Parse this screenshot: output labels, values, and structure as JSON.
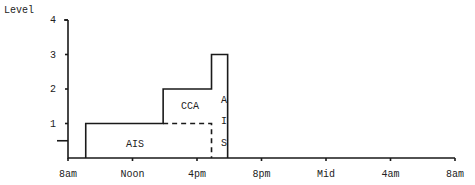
{
  "chart_data": {
    "type": "step-area",
    "title": "",
    "ylabel": "Level",
    "xlabel": "",
    "ylim": [
      0,
      4
    ],
    "y_ticks": [
      "1",
      "2",
      "3",
      "4"
    ],
    "x_ticks": [
      "8am",
      "Noon",
      "4pm",
      "8pm",
      "Mid",
      "4am",
      "8am"
    ],
    "x_range_hours": [
      0,
      24
    ],
    "grid": false,
    "legend": null,
    "outline": [
      {
        "from_hour": 1.1,
        "to_hour": 5.9,
        "level": 1
      },
      {
        "from_hour": 5.9,
        "to_hour": 8.9,
        "level": 2
      },
      {
        "from_hour": 8.9,
        "to_hour": 9.9,
        "level": 3
      }
    ],
    "regions": [
      {
        "label": "AIS",
        "from_hour": 1.1,
        "to_hour": 8.9,
        "level": 1,
        "boundary": "dashed"
      },
      {
        "label": "CCA",
        "from_hour": 5.9,
        "to_hour": 8.9,
        "level": 2
      },
      {
        "label": "A I S",
        "from_hour": 8.9,
        "to_hour": 9.9,
        "level": 3,
        "orientation": "vertical"
      }
    ],
    "annotations": [
      {
        "type": "y-marker",
        "level": 0.5
      }
    ]
  },
  "labels": {
    "y_axis_title": "Level",
    "region_ais": "AIS",
    "region_cca": "CCA",
    "region_ais_vertical": [
      "A",
      "I",
      "S"
    ]
  }
}
